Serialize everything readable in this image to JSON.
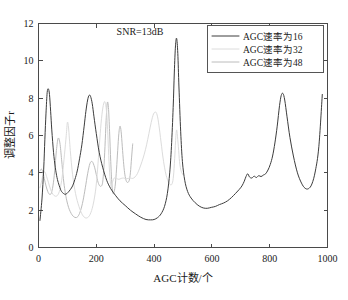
{
  "chart_data": {
    "type": "line",
    "title": "",
    "xlabel": "AGC计数/个",
    "ylabel": "调整因子r",
    "xlim": [
      0,
      1000
    ],
    "ylim": [
      0,
      12
    ],
    "xticks": [
      0,
      200,
      400,
      600,
      800,
      1000
    ],
    "yticks": [
      0,
      2,
      4,
      6,
      8,
      10,
      12
    ],
    "xtick_labels": [
      "0",
      "200",
      "400",
      "600",
      "800",
      "1000"
    ],
    "ytick_labels": [
      "0",
      "2",
      "4",
      "6",
      "8",
      "10",
      "12"
    ],
    "grid": false,
    "legend_position": "upper right",
    "annotations": [
      {
        "text": "SNR=13dB",
        "x": 330,
        "y": 11.3
      }
    ],
    "series": [
      {
        "name": "AGC速率为16",
        "color": "#3c3c3c",
        "x": [
          5,
          12,
          18,
          22,
          26,
          30,
          34,
          38,
          42,
          46,
          52,
          58,
          64,
          70,
          78,
          86,
          94,
          102,
          110,
          118,
          126,
          134,
          142,
          150,
          158,
          164,
          170,
          175,
          180,
          186,
          192,
          200,
          210,
          222,
          236,
          250,
          266,
          282,
          300,
          318,
          336,
          354,
          372,
          388,
          400,
          412,
          424,
          436,
          446,
          454,
          460,
          466,
          470,
          474,
          478,
          482,
          486,
          492,
          498,
          506,
          516,
          528,
          542,
          556,
          570,
          584,
          598,
          612,
          626,
          640,
          654,
          668,
          682,
          694,
          704,
          712,
          718,
          724,
          730,
          738,
          746,
          754,
          762,
          770,
          778,
          786,
          794,
          802,
          810,
          818,
          826,
          834,
          840,
          846,
          852,
          860,
          870,
          882,
          896,
          910,
          922,
          934,
          946,
          958,
          970,
          982
        ],
        "y": [
          1.45,
          2.6,
          4.2,
          5.8,
          7.2,
          8.3,
          8.5,
          8.2,
          7.3,
          6.3,
          5.1,
          4.3,
          3.75,
          3.4,
          3.05,
          2.9,
          2.85,
          2.95,
          3.1,
          3.3,
          3.65,
          4.1,
          4.75,
          5.5,
          6.5,
          7.3,
          7.9,
          8.15,
          8.1,
          7.7,
          7.0,
          6.1,
          5.1,
          4.3,
          3.6,
          3.15,
          2.8,
          2.5,
          2.25,
          2.0,
          1.8,
          1.62,
          1.5,
          1.48,
          1.5,
          1.6,
          1.8,
          2.2,
          2.9,
          4.0,
          5.4,
          7.5,
          9.4,
          10.8,
          11.2,
          10.4,
          8.6,
          6.2,
          4.6,
          3.6,
          3.0,
          2.65,
          2.4,
          2.22,
          2.12,
          2.1,
          2.15,
          2.2,
          2.3,
          2.38,
          2.5,
          2.68,
          2.9,
          3.1,
          3.3,
          3.55,
          3.8,
          3.95,
          3.78,
          3.72,
          3.82,
          3.75,
          3.85,
          3.8,
          3.88,
          3.95,
          4.15,
          4.45,
          4.9,
          5.6,
          6.5,
          7.6,
          8.15,
          8.25,
          7.9,
          7.0,
          5.9,
          4.9,
          4.0,
          3.45,
          3.18,
          3.15,
          3.4,
          4.1,
          5.4,
          8.2
        ]
      },
      {
        "name": "AGC速率为32",
        "color": "#dcdcdc",
        "x": [
          5,
          10,
          16,
          22,
          28,
          34,
          42,
          50,
          58,
          66,
          74,
          82,
          90,
          96,
          100,
          104,
          110,
          118,
          128,
          140,
          152,
          164,
          176,
          186,
          194,
          200,
          206,
          212,
          218,
          224,
          230,
          236,
          240,
          244,
          248,
          252,
          256,
          262,
          270,
          278,
          286,
          294,
          302,
          310,
          318,
          326,
          334,
          342,
          350,
          358,
          366,
          374,
          382,
          390,
          398,
          406,
          412,
          418,
          422,
          426,
          430,
          436,
          442,
          450,
          458,
          464,
          468,
          472,
          474,
          476,
          478,
          480,
          484,
          488,
          492,
          496,
          500
        ],
        "y": [
          3.2,
          3.5,
          3.95,
          4.05,
          3.8,
          3.5,
          3.1,
          2.85,
          2.75,
          2.8,
          3.1,
          3.8,
          5.0,
          6.0,
          6.7,
          6.4,
          5.2,
          3.9,
          2.9,
          2.2,
          1.75,
          1.58,
          1.7,
          2.1,
          2.7,
          3.4,
          4.5,
          5.8,
          6.9,
          7.6,
          7.8,
          7.2,
          6.0,
          4.6,
          3.6,
          3.2,
          3.5,
          3.72,
          3.7,
          3.65,
          3.7,
          3.72,
          3.68,
          3.7,
          3.72,
          3.7,
          3.78,
          3.95,
          4.25,
          4.6,
          5.0,
          5.5,
          6.1,
          6.7,
          7.15,
          7.25,
          7.0,
          6.4,
          5.9,
          5.4,
          4.9,
          4.3,
          3.85,
          3.5,
          3.35,
          3.5,
          4.0,
          5.0,
          5.6,
          6.1,
          6.3,
          6.1,
          5.4,
          4.6,
          4.2,
          4.0,
          3.9
        ]
      },
      {
        "name": "AGC速率为48",
        "color": "#bcbcbc",
        "x": [
          5,
          10,
          15,
          20,
          26,
          32,
          38,
          44,
          50,
          56,
          62,
          68,
          74,
          80,
          86,
          92,
          98,
          104,
          110,
          116,
          122,
          130,
          138,
          146,
          154,
          162,
          170,
          178,
          186,
          194,
          200,
          206,
          212,
          218,
          222,
          226,
          230,
          234,
          238,
          242,
          246,
          250,
          254,
          258,
          262,
          266,
          270,
          274,
          278,
          282,
          286,
          290,
          294,
          298,
          302,
          306,
          310,
          314,
          318,
          322,
          326
        ],
        "y": [
          4.1,
          4.2,
          4.05,
          3.7,
          3.3,
          3.0,
          2.85,
          2.9,
          3.3,
          4.1,
          5.2,
          5.85,
          5.6,
          4.7,
          3.7,
          3.0,
          2.5,
          2.15,
          1.92,
          1.75,
          1.65,
          1.6,
          1.7,
          2.0,
          2.5,
          3.2,
          3.95,
          4.5,
          4.6,
          4.3,
          3.9,
          3.5,
          3.3,
          3.3,
          3.5,
          4.2,
          5.4,
          6.8,
          7.75,
          7.5,
          6.2,
          4.6,
          3.4,
          2.9,
          3.0,
          3.4,
          4.2,
          5.2,
          6.1,
          6.5,
          6.2,
          5.4,
          4.6,
          4.0,
          3.65,
          3.5,
          3.5,
          3.6,
          4.0,
          4.8,
          5.55
        ]
      }
    ]
  },
  "legend": {
    "items": [
      {
        "label": "AGC速率为16"
      },
      {
        "label": "AGC速率为32"
      },
      {
        "label": "AGC速率为48"
      }
    ]
  },
  "annotation": {
    "snr_label": "SNR=13dB"
  },
  "axes": {
    "x_title": "AGC计数/个",
    "y_title": "调整因子r"
  }
}
